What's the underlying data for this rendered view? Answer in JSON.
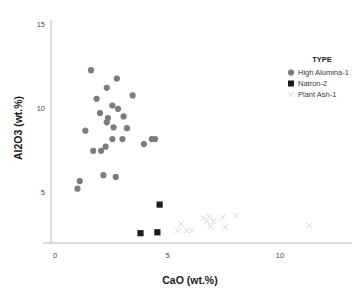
{
  "chart_data": {
    "type": "scatter",
    "title": "",
    "xlabel": "CaO (wt.%)",
    "ylabel": "Al2O3 (wt.%)",
    "xlim": [
      -0.6,
      13.2
    ],
    "ylim": [
      1.6,
      15.9
    ],
    "xticks": [
      0,
      5,
      10
    ],
    "yticks": [
      5,
      10,
      15
    ],
    "xtick_labels": [
      "0",
      "5",
      "10"
    ],
    "ytick_labels": [
      "5",
      "10",
      "15"
    ],
    "grid": false,
    "legend_title": "TYPE",
    "legend_position": "top-right",
    "series": [
      {
        "name": "High Alumina-1",
        "marker": "circle",
        "color": "#7c7c7c",
        "points": [
          [
            1.6,
            12.25
          ],
          [
            2.75,
            11.75
          ],
          [
            2.3,
            11.2
          ],
          [
            1.85,
            10.55
          ],
          [
            3.45,
            10.75
          ],
          [
            2.55,
            10.15
          ],
          [
            2.8,
            9.95
          ],
          [
            2.0,
            9.7
          ],
          [
            3.05,
            9.5
          ],
          [
            2.35,
            9.4
          ],
          [
            2.3,
            9.15
          ],
          [
            1.35,
            8.65
          ],
          [
            2.6,
            8.85
          ],
          [
            3.2,
            8.8
          ],
          [
            2.55,
            8.15
          ],
          [
            3.0,
            8.15
          ],
          [
            4.3,
            8.15
          ],
          [
            4.45,
            8.15
          ],
          [
            3.95,
            7.85
          ],
          [
            1.7,
            7.45
          ],
          [
            2.05,
            7.45
          ],
          [
            2.25,
            7.7
          ],
          [
            2.15,
            6.0
          ],
          [
            2.7,
            5.9
          ],
          [
            1.1,
            5.65
          ],
          [
            1.0,
            5.2
          ]
        ]
      },
      {
        "name": "Natron-2",
        "marker": "square",
        "color": "#1c1c1c",
        "points": [
          [
            4.65,
            4.25
          ],
          [
            3.8,
            2.55
          ],
          [
            4.55,
            2.6
          ]
        ]
      },
      {
        "name": "Plant Ash-1",
        "marker": "cross",
        "color": "#d6d6d6",
        "points": [
          [
            5.45,
            2.7
          ],
          [
            5.6,
            3.1
          ],
          [
            5.85,
            2.7
          ],
          [
            6.1,
            2.7
          ],
          [
            6.6,
            3.45
          ],
          [
            6.75,
            3.25
          ],
          [
            6.85,
            3.55
          ],
          [
            6.9,
            2.95
          ],
          [
            7.05,
            3.25
          ],
          [
            7.45,
            3.5
          ],
          [
            7.55,
            2.9
          ],
          [
            8.05,
            3.6
          ],
          [
            11.3,
            3.0
          ]
        ]
      }
    ]
  }
}
